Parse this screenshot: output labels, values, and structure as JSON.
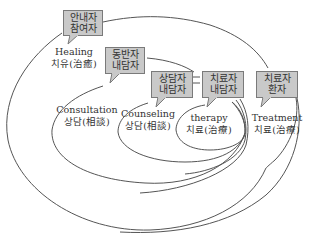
{
  "diagram": {
    "type": "nested-ellipse concept diagram",
    "regions": [
      {
        "id": "healing",
        "english": "Healing",
        "korean": "치유(治癒)"
      },
      {
        "id": "consultation",
        "english": "Consultation",
        "korean": "상담(相談)"
      },
      {
        "id": "counseling",
        "english": "Counseling",
        "korean": "상담(相談)"
      },
      {
        "id": "therapy",
        "english": "therapy",
        "korean": "치료(治療)"
      },
      {
        "id": "treatment",
        "english": "Treatment",
        "korean": "치료(治療)"
      }
    ],
    "callouts": [
      {
        "id": "healing",
        "line1": "안내자",
        "line2": "참여자"
      },
      {
        "id": "consultation",
        "line1": "동반자",
        "line2": "내담자"
      },
      {
        "id": "counseling",
        "line1": "상담자",
        "line2": "내담자"
      },
      {
        "id": "therapy",
        "line1": "치료자",
        "line2": "내담자"
      },
      {
        "id": "treatment",
        "line1": "치료자",
        "line2": "환자"
      }
    ],
    "colors": {
      "callout_fill": "#c9c9c9",
      "callout_border": "#7a7a7a",
      "line": "#555555",
      "text": "#333333"
    }
  }
}
